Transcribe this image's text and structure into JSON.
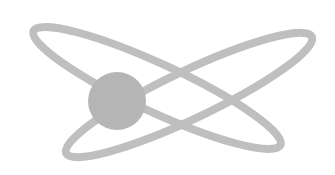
{
  "logo": {
    "icon": "atom-icon",
    "colors": {
      "background": "#ffffff",
      "orbit": "#bfbfbf",
      "nucleus": "#b5b5b5"
    },
    "orbits": [
      {
        "cx": 157,
        "cy": 88,
        "rx": 136,
        "ry": 24,
        "rotate": 24.8
      },
      {
        "cx": 189,
        "cy": 95,
        "rx": 136,
        "ry": 24,
        "rotate": -25.4
      }
    ],
    "nucleus": {
      "cx": 117,
      "cy": 101,
      "r": 29
    }
  }
}
